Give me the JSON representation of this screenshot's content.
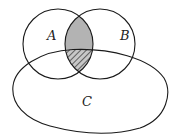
{
  "diagram": {
    "type": "venn",
    "sets": [
      {
        "id": "A",
        "label": "A"
      },
      {
        "id": "B",
        "label": "B"
      },
      {
        "id": "C",
        "label": "C"
      }
    ],
    "regions": [
      {
        "name": "A∩B outside C",
        "style": "solid-gray",
        "color": "#b5b5b5"
      },
      {
        "name": "A∩B∩C",
        "style": "hatched",
        "color": "#444444"
      }
    ],
    "stroke_color": "#1a1a1a"
  }
}
